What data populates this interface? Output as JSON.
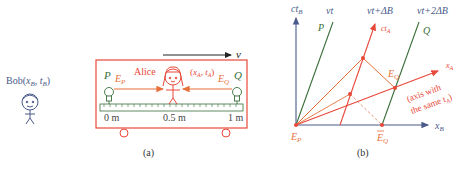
{
  "colors": {
    "red": "#e8483a",
    "orange": "#e8703a",
    "green": "#3a6e3a",
    "navy": "#4a5a8a",
    "dashed": "#e09070"
  },
  "panel_a": {
    "bob_label": "Bob(",
    "bob_xb": "x",
    "bob_xb_sub": "B",
    "bob_sep": ", ",
    "bob_tb": "t",
    "bob_tb_sub": "B",
    "bob_close": ")",
    "velocity_label": "v",
    "alice_label": "Alice",
    "alice_coords_open": "(",
    "alice_xa": "x",
    "alice_xa_sub": "A",
    "alice_sep": ", ",
    "alice_ta": "t",
    "alice_ta_sub": "A",
    "alice_close": ")",
    "p_label": "P",
    "q_label": "Q",
    "ep_label": "E",
    "ep_sub": "P",
    "eq_label": "E",
    "eq_sub": "Q",
    "ruler_ticks": [
      "0 m",
      "0.5 m",
      "1 m"
    ],
    "caption": "(a)"
  },
  "panel_b": {
    "ctb_label": "ct",
    "ctb_sub": "B",
    "vt_label": "vt",
    "vtdb_label": "vt+ΔB",
    "vt2db_label": "vt+2ΔB",
    "p_label": "P",
    "q_label": "Q",
    "cta_label": "ct",
    "cta_sub": "A",
    "xa_label": "x",
    "xa_sub": "A",
    "axis_note_line1": "(axis with",
    "axis_note_line2": "the same t",
    "axis_note_sub": "A",
    "axis_note_close": ")",
    "eq_label": "E",
    "eq_sub": "Q",
    "ep_label": "E",
    "ep_sub": "P",
    "eqbar_label": "E",
    "eqbar_sub": "Q",
    "xb_label": "x",
    "xb_sub": "B",
    "caption": "(b)"
  }
}
